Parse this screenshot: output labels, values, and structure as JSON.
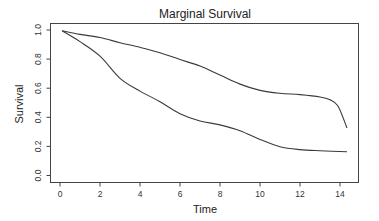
{
  "chart_data": {
    "type": "line",
    "title": "Marginal Survival",
    "xlabel": "Time",
    "ylabel": "Survival",
    "xlim": [
      -0.5,
      15
    ],
    "ylim": [
      0.0,
      1.0
    ],
    "xticks": [
      0,
      2,
      4,
      6,
      8,
      10,
      12,
      14
    ],
    "yticks": [
      0.0,
      0.2,
      0.4,
      0.6,
      0.8,
      1.0
    ],
    "xtick_labels": [
      "0",
      "2",
      "4",
      "6",
      "8",
      "10",
      "12",
      "14"
    ],
    "ytick_labels": [
      "0.0",
      "0.2",
      "0.4",
      "0.6",
      "0.8",
      "1.0"
    ],
    "grid": false,
    "legend": null,
    "series": [
      {
        "name": "upper curve",
        "color": "#3a3a3a",
        "x": [
          0.1,
          1,
          2,
          3,
          4,
          5,
          6,
          7,
          8,
          9,
          10,
          11,
          12,
          13,
          13.5,
          13.9,
          14.35
        ],
        "y": [
          0.995,
          0.97,
          0.948,
          0.913,
          0.881,
          0.844,
          0.797,
          0.752,
          0.69,
          0.628,
          0.585,
          0.565,
          0.556,
          0.54,
          0.52,
          0.478,
          0.326
        ]
      },
      {
        "name": "lower curve",
        "color": "#3a3a3a",
        "x": [
          0.1,
          1,
          2,
          3,
          4,
          5,
          6,
          7,
          8,
          9,
          10,
          11,
          12,
          13,
          14.35
        ],
        "y": [
          0.995,
          0.92,
          0.82,
          0.668,
          0.58,
          0.507,
          0.425,
          0.375,
          0.348,
          0.308,
          0.248,
          0.198,
          0.178,
          0.17,
          0.163
        ]
      }
    ]
  }
}
